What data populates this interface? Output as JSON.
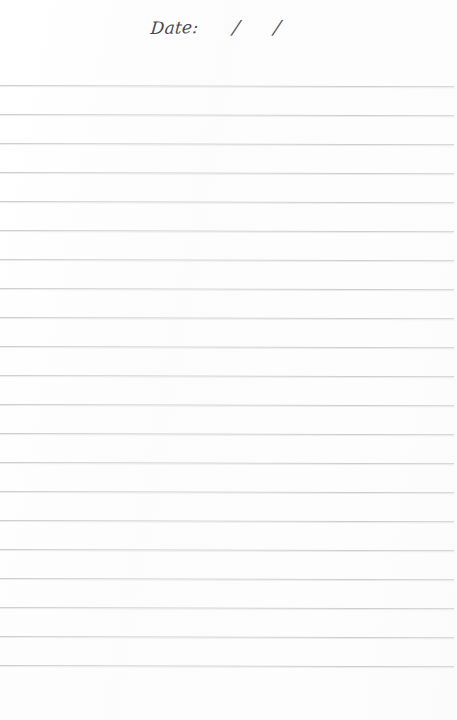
{
  "document": {
    "type": "lined-notebook-page",
    "paper_color": "#fdfdfd",
    "rule_color": "#c9cacd",
    "ink_color": "#2c2c34"
  },
  "header": {
    "date_label": "Date:",
    "slash_1": "/",
    "slash_2": "/",
    "date_value": ""
  },
  "rules": {
    "count": 21,
    "first_line_y": 85,
    "spacing_px": 29,
    "left_x": 0,
    "right_x": 454
  }
}
